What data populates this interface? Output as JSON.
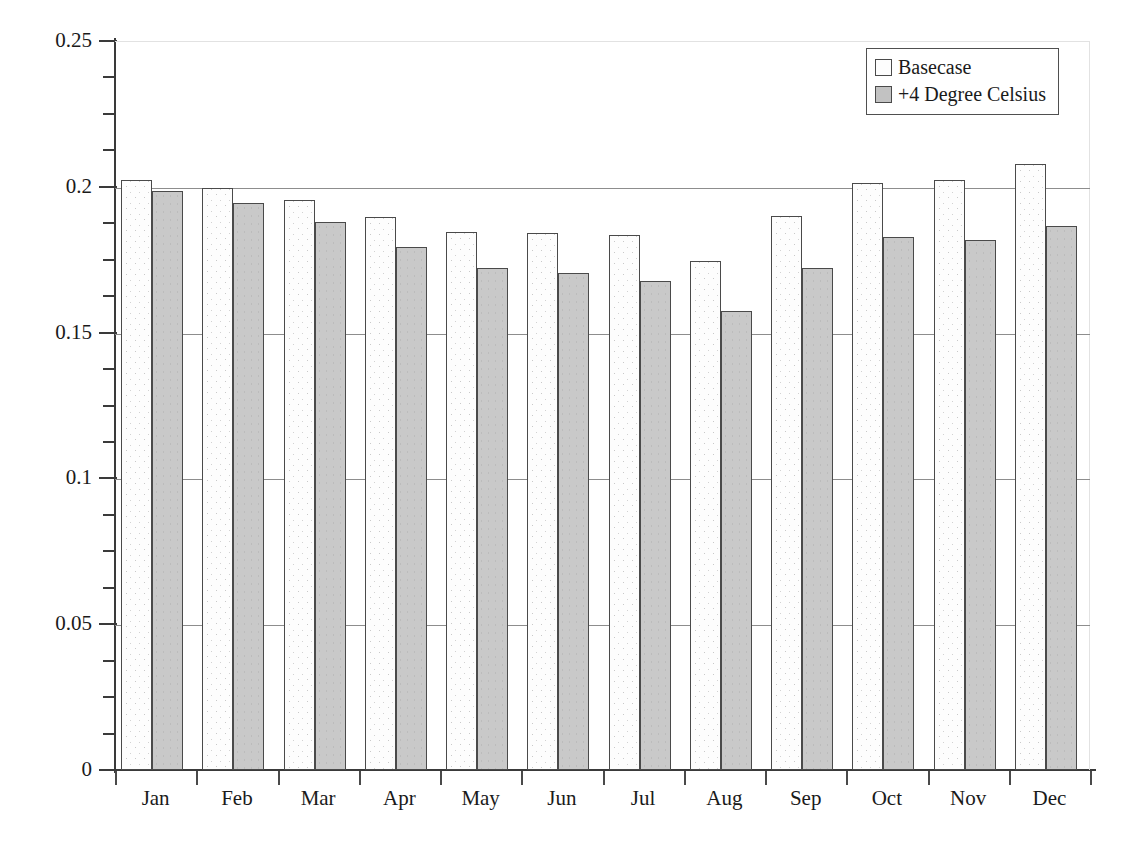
{
  "chart_data": {
    "type": "bar",
    "title": "",
    "xlabel": "",
    "ylabel": "Soil Moisture Content",
    "categories": [
      "Jan",
      "Feb",
      "Mar",
      "Apr",
      "May",
      "Jun",
      "Jul",
      "Aug",
      "Sep",
      "Oct",
      "Nov",
      "Dec"
    ],
    "series": [
      {
        "name": "Basecase",
        "values": [
          0.2025,
          0.1995,
          0.1955,
          0.1895,
          0.1846,
          0.1843,
          0.1835,
          0.1745,
          0.19,
          0.2012,
          0.2025,
          0.2078
        ]
      },
      {
        "name": "+4 Degree Celsius",
        "values": [
          0.1985,
          0.1945,
          0.1878,
          0.1795,
          0.1723,
          0.1703,
          0.1678,
          0.1575,
          0.1723,
          0.1828,
          0.1818,
          0.1865
        ]
      }
    ],
    "ylim": [
      0,
      0.25
    ],
    "ytick_labels": [
      "0",
      "0.05",
      "0.1",
      "0.15",
      "0.2",
      "0.25"
    ],
    "ytick_values": [
      0,
      0.05,
      0.1,
      0.15,
      0.2,
      0.25
    ],
    "yminor_step": 0.0125,
    "grid": "horizontal-major",
    "legend_position": "top-right",
    "colors": {
      "basecase_fill": "#fdfdfd",
      "warm_fill": "#c9c9c9",
      "bar_edge": "#4a4a4a",
      "axis": "#3a3a3a",
      "gridline": "#8d8d8d",
      "plot_border": "#e2e2e2"
    }
  },
  "legend": {
    "items": [
      {
        "label": "Basecase",
        "swatch": "basecase-swatch"
      },
      {
        "label": "+4 Degree Celsius",
        "swatch": "warm-swatch"
      }
    ]
  },
  "caption": ""
}
